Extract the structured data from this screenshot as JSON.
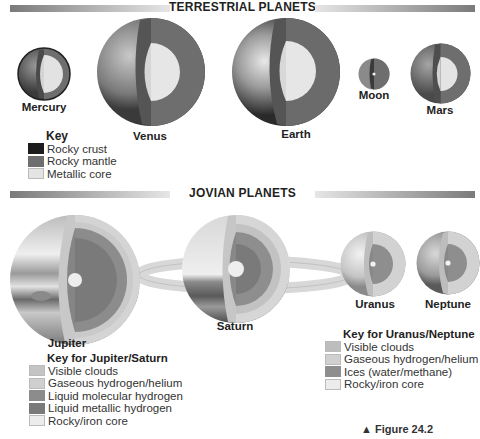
{
  "terrestrial": {
    "title": "TERRESTRIAL PLANETS",
    "planets": [
      {
        "name": "Mercury"
      },
      {
        "name": "Venus"
      },
      {
        "name": "Earth"
      },
      {
        "name": "Moon"
      },
      {
        "name": "Mars"
      }
    ],
    "key": {
      "title": "Key",
      "items": [
        {
          "label": "Rocky crust",
          "color": "#1c1c1c"
        },
        {
          "label": "Rocky mantle",
          "color": "#6e6e6e"
        },
        {
          "label": "Metallic core",
          "color": "#e4e4e4"
        }
      ]
    }
  },
  "jovian": {
    "title": "JOVIAN PLANETS",
    "planets": [
      {
        "name": "Jupiter"
      },
      {
        "name": "Saturn"
      },
      {
        "name": "Uranus"
      },
      {
        "name": "Neptune"
      }
    ],
    "key_jupiter_saturn": {
      "title": "Key for Jupiter/Saturn",
      "items": [
        {
          "label": "Visible clouds",
          "color": "#c4c4c4"
        },
        {
          "label": "Gaseous hydrogen/helium",
          "color": "#cfcfcf"
        },
        {
          "label": "Liquid molecular hydrogen",
          "color": "#8c8c8c"
        },
        {
          "label": "Liquid metallic hydrogen",
          "color": "#7a7a7a"
        },
        {
          "label": "Rocky/iron core",
          "color": "#ececec"
        }
      ]
    },
    "key_uranus_neptune": {
      "title": "Key for Uranus/Neptune",
      "items": [
        {
          "label": "Visible clouds",
          "color": "#bdbdbd"
        },
        {
          "label": "Gaseous hydrogen/helium",
          "color": "#d0d0d0"
        },
        {
          "label": "Ices (water/methane)",
          "color": "#8e8e8e"
        },
        {
          "label": "Rocky/iron core",
          "color": "#ececec"
        }
      ]
    }
  },
  "figure_caption": "▲ Figure 24.2"
}
